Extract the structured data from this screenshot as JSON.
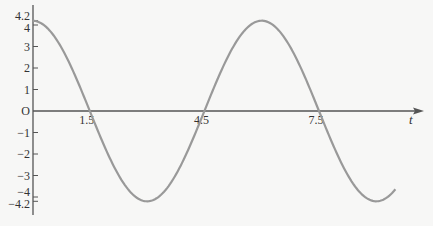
{
  "chart_data": {
    "type": "line",
    "title": "",
    "xlabel": "t",
    "ylabel": "",
    "function": "y = 4.2 cos(pi t / 3)",
    "amplitude": 4.2,
    "period": 6,
    "x_ticks": [
      1.5,
      4.5,
      7.5
    ],
    "x_tick_labels": [
      "1.5",
      "4.5",
      "7.5"
    ],
    "y_ticks": [
      4.2,
      4,
      3,
      2,
      1,
      0,
      -1,
      -2,
      -3,
      -4,
      -4.2
    ],
    "y_tick_labels": [
      "4.2",
      "4",
      "3",
      "2",
      "1",
      "O",
      "−1",
      "−2",
      "−3",
      "−4",
      "−4.2"
    ],
    "xlim": [
      0,
      9.5
    ],
    "ylim": [
      -4.2,
      4.2
    ],
    "grid": false,
    "legend": null,
    "series": [
      {
        "name": "curve",
        "color": "#999999",
        "x": [
          0,
          1.5,
          3,
          4.5,
          6,
          7.5,
          9,
          9.5
        ],
        "values": [
          4.2,
          0,
          -4.2,
          0,
          4.2,
          0,
          -4.2,
          -3.64
        ]
      }
    ]
  },
  "colors": {
    "background": "#f7f7f6",
    "axis": "#555555",
    "curve": "#999999"
  }
}
